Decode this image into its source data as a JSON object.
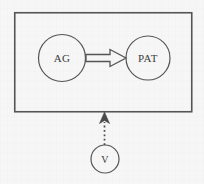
{
  "diagram": {
    "background_color": "#f6f6f6",
    "stroke_color": "#555555",
    "text_color": "#3a3a3a",
    "boundary": {
      "name": "clause-boundary-box",
      "x": 14,
      "y": 12,
      "width": 178,
      "height": 100
    },
    "nodes": [
      {
        "id": "ag",
        "label": "AG",
        "cx": 62,
        "cy": 58,
        "r": 23.5
      },
      {
        "id": "pat",
        "label": "PAT",
        "cx": 148,
        "cy": 58,
        "r": 22
      },
      {
        "id": "v",
        "label": "V",
        "cx": 105,
        "cy": 159,
        "r": 14
      }
    ],
    "edges": [
      {
        "id": "ag-to-pat",
        "style": "hollow-block-arrow",
        "from": "ag",
        "to": "pat",
        "direction": "right"
      },
      {
        "id": "v-to-boundary",
        "style": "dotted-arrow",
        "from": "v",
        "to": "clause-boundary-box",
        "direction": "up"
      }
    ]
  }
}
